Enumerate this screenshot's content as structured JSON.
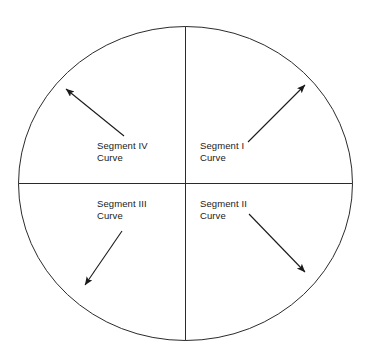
{
  "diagram": {
    "shape": "circle",
    "colors": {
      "stroke": "#2b2b2b",
      "background": "#ffffff",
      "text": "#1a1a1a",
      "arrow": "#1a1a1a"
    },
    "circle": {
      "cx": 185.5,
      "cy": 183.5,
      "rx": 167,
      "ry": 157,
      "stroke_width": 1
    },
    "axes": {
      "vertical": {
        "x": 185.5,
        "y1": 26.5,
        "y2": 340.5
      },
      "horizontal": {
        "y": 183.5,
        "x1": 18.5,
        "x2": 352.5
      }
    },
    "quadrants": [
      {
        "id": "segment-1",
        "name": "Segment I",
        "label_line1": "Segment I",
        "label_line2": "Curve",
        "position": "top-right",
        "arrow": {
          "x1": 248,
          "y1": 142,
          "x2": 307,
          "y2": 83,
          "direction": "up-right"
        }
      },
      {
        "id": "segment-2",
        "name": "Segment II",
        "label_line1": "Segment II",
        "label_line2": "Curve",
        "position": "bottom-right",
        "arrow": {
          "x1": 249,
          "y1": 214,
          "x2": 307,
          "y2": 274,
          "direction": "down-right"
        }
      },
      {
        "id": "segment-3",
        "name": "Segment III",
        "label_line1": "Segment III",
        "label_line2": "Curve",
        "position": "bottom-left",
        "arrow": {
          "x1": 122,
          "y1": 231,
          "x2": 83,
          "y2": 287,
          "direction": "down-left"
        }
      },
      {
        "id": "segment-4",
        "name": "Segment IV",
        "label_line1": "Segment IV",
        "label_line2": "Curve",
        "position": "top-left",
        "arrow": {
          "x1": 124,
          "y1": 136,
          "x2": 64,
          "y2": 87,
          "direction": "up-left"
        }
      }
    ]
  }
}
